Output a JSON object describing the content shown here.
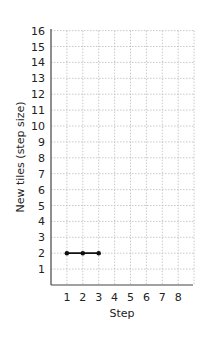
{
  "chart_data": {
    "type": "line",
    "title": "",
    "xlabel": "Step",
    "ylabel": "New tiles (step size)",
    "x": [
      1,
      2,
      3
    ],
    "values": [
      2,
      2,
      2
    ],
    "series": [
      {
        "name": "New tiles",
        "x": [
          1,
          2,
          3
        ],
        "values": [
          2,
          2,
          2
        ]
      }
    ],
    "xticks": [
      1,
      2,
      3,
      4,
      5,
      6,
      7,
      8
    ],
    "yticks": [
      1,
      2,
      3,
      4,
      5,
      6,
      7,
      8,
      9,
      10,
      11,
      12,
      13,
      14,
      15,
      16
    ],
    "xlim": [
      0,
      9
    ],
    "ylim": [
      0,
      16
    ],
    "grid": true,
    "legend": "none"
  },
  "colors": {
    "line": "#111111",
    "grid": "#bbbbbb",
    "axis": "#444444"
  }
}
